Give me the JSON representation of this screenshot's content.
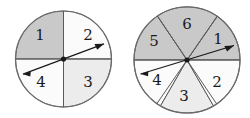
{
  "figure": {
    "kind": "two-spinners-diagram",
    "background_color": "#ffffff",
    "outline_color": "#6b6b6b",
    "divider_color": "#5a5a5a",
    "pointer_color": "#1a1a1a",
    "hub_color": "#1a1a1a",
    "label_color": "#1a1a1a",
    "fill_gray": "#c9c9c9",
    "fill_light": "#ececec",
    "fill_white": "#fbfbfb"
  },
  "spinners": [
    {
      "name": "left-spinner",
      "sector_count": 4,
      "center_x": 63.5,
      "center_y": 59,
      "radius": 48,
      "pointer_angle_deg": 22,
      "pointer_tip_label": "2",
      "sectors": [
        {
          "label": "1",
          "start_deg": 90,
          "end_deg": 180,
          "fill": "#c9c9c9",
          "label_x": 40,
          "label_y": 36
        },
        {
          "label": "2",
          "start_deg": 0,
          "end_deg": 90,
          "fill": "#fbfbfb",
          "label_x": 88,
          "label_y": 36
        },
        {
          "label": "3",
          "start_deg": 270,
          "end_deg": 360,
          "fill": "#ececec",
          "label_x": 88,
          "label_y": 83
        },
        {
          "label": "4",
          "start_deg": 180,
          "end_deg": 270,
          "fill": "#fbfbfb",
          "label_x": 41,
          "label_y": 83
        }
      ]
    },
    {
      "name": "right-spinner",
      "sector_count": 6,
      "center_x": 62,
      "center_y": 60,
      "radius": 53,
      "pointer_angle_deg": 17,
      "pointer_tip_label": "1",
      "sectors": [
        {
          "label": "1",
          "start_deg": 0,
          "end_deg": 56,
          "fill": "#c9c9c9",
          "label_x": 93,
          "label_y": 40
        },
        {
          "label": "2",
          "start_deg": 300,
          "end_deg": 360,
          "fill": "#fbfbfb",
          "label_x": 92,
          "label_y": 83
        },
        {
          "label": "3",
          "start_deg": 240,
          "end_deg": 300,
          "fill": "#ececec",
          "label_x": 59,
          "label_y": 97
        },
        {
          "label": "4",
          "start_deg": 180,
          "end_deg": 240,
          "fill": "#fbfbfb",
          "label_x": 32,
          "label_y": 81
        },
        {
          "label": "5",
          "start_deg": 124,
          "end_deg": 180,
          "fill": "#c9c9c9",
          "label_x": 29,
          "label_y": 42
        },
        {
          "label": "6",
          "start_deg": 56,
          "end_deg": 124,
          "fill": "#c9c9c9",
          "label_x": 62,
          "label_y": 25
        }
      ]
    }
  ]
}
